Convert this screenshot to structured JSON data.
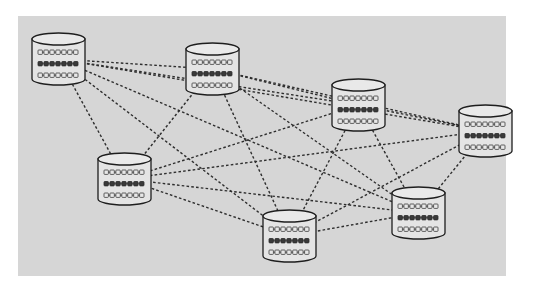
{
  "diagram": {
    "type": "full-mesh-network",
    "frame": {
      "x": 18,
      "y": 16,
      "width": 488,
      "height": 260,
      "background": "#d6d6d6"
    },
    "colors": {
      "page_background": "#ffffff",
      "frame_background": "#d6d6d6",
      "edge": "#2e2e2e",
      "cylinder_fill": "#e4e4e4",
      "cylinder_stroke": "#1e1e1e",
      "bead_light": "#e8e8e8",
      "bead_dark": "#3a3a3a"
    },
    "node_shape": {
      "icon": "database-cylinder-icon",
      "width": 53,
      "height": 52,
      "rows": [
        {
          "style": "light",
          "beads": 7
        },
        {
          "style": "dark",
          "beads": 7
        },
        {
          "style": "light",
          "beads": 7
        }
      ]
    },
    "nodes": [
      {
        "id": "db1",
        "x": 32,
        "y": 33
      },
      {
        "id": "db2",
        "x": 186,
        "y": 43
      },
      {
        "id": "db3",
        "x": 332,
        "y": 79
      },
      {
        "id": "db4",
        "x": 459,
        "y": 105
      },
      {
        "id": "db5",
        "x": 98,
        "y": 153
      },
      {
        "id": "db6",
        "x": 263,
        "y": 210
      },
      {
        "id": "db7",
        "x": 392,
        "y": 187
      }
    ],
    "edges": [
      [
        "db1",
        "db2"
      ],
      [
        "db1",
        "db3"
      ],
      [
        "db1",
        "db4"
      ],
      [
        "db1",
        "db5"
      ],
      [
        "db1",
        "db6"
      ],
      [
        "db1",
        "db7"
      ],
      [
        "db2",
        "db3"
      ],
      [
        "db2",
        "db4"
      ],
      [
        "db2",
        "db5"
      ],
      [
        "db2",
        "db6"
      ],
      [
        "db2",
        "db7"
      ],
      [
        "db3",
        "db4"
      ],
      [
        "db3",
        "db5"
      ],
      [
        "db3",
        "db6"
      ],
      [
        "db3",
        "db7"
      ],
      [
        "db4",
        "db5"
      ],
      [
        "db4",
        "db6"
      ],
      [
        "db4",
        "db7"
      ],
      [
        "db5",
        "db6"
      ],
      [
        "db5",
        "db7"
      ],
      [
        "db6",
        "db7"
      ]
    ]
  }
}
